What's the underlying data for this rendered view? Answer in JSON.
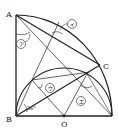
{
  "diagram": {
    "type": "geometry",
    "points": {
      "A": {
        "label": "A",
        "x": 16,
        "y": 15
      },
      "B": {
        "label": "B",
        "x": 16,
        "y": 116
      },
      "C": {
        "label": "C",
        "x": 100,
        "y": 65
      },
      "O": {
        "label": "O",
        "x": 64,
        "y": 116
      },
      "D": {
        "label": "",
        "x": 112,
        "y": 116
      },
      "P": {
        "label": "",
        "x": 32,
        "y": 80
      }
    },
    "angle_labels": {
      "a": "ア",
      "i": "イ",
      "u": "ウ",
      "e": "エ"
    },
    "given_angle": "36°",
    "colors": {
      "line": "#222222",
      "background": "#ffffff"
    }
  }
}
